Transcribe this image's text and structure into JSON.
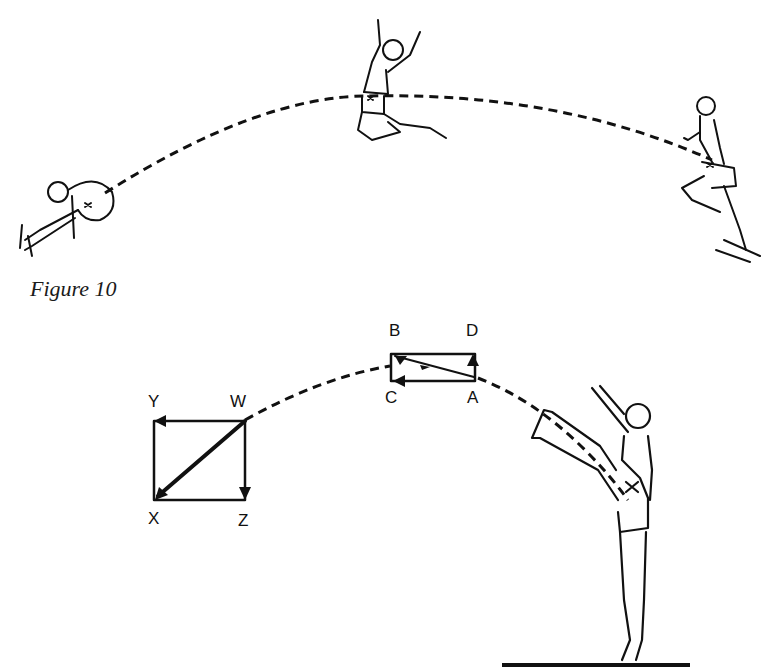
{
  "figure": {
    "caption": "Figure 10",
    "top_panel": {
      "description": "Long jump sequence: take-off (right), flight (center), landing (left) joined by dashed trajectory of the centre of gravity",
      "phases": [
        "landing",
        "flight",
        "take-off"
      ]
    },
    "bottom_panel": {
      "description": "Kicking athlete on ground; dashed trajectory with vector rectangles",
      "vector_box_small": {
        "labels": {
          "top_left": "B",
          "top_right": "D",
          "bottom_left": "C",
          "bottom_right": "A"
        }
      },
      "vector_box_large": {
        "labels": {
          "top_left": "Y",
          "top_right": "W",
          "bottom_left": "X",
          "bottom_right": "Z"
        }
      }
    }
  },
  "colors": {
    "ink": "#111111",
    "background": "#ffffff"
  }
}
